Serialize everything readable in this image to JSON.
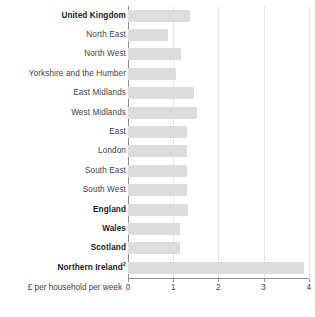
{
  "chart_data": {
    "type": "bar",
    "orientation": "horizontal",
    "title": "",
    "subtitle": "",
    "xlabel": "£ per household per week",
    "ylabel": "",
    "xlim": [
      0,
      4
    ],
    "xticks": [
      0,
      1,
      2,
      3,
      4
    ],
    "xtick_labels": [
      "0",
      "1",
      "2",
      "3",
      "4"
    ],
    "grid": "vertical",
    "legend": "none",
    "bar_color": "#dcdcdc",
    "axis_color": "#8d8d8d",
    "gridline_color": "#e6e6e6",
    "categories": [
      "United Kingdom",
      "North East",
      "North West",
      "Yorkshire and the Humber",
      "East Midlands",
      "West Midlands",
      "East",
      "London",
      "South East",
      "South West",
      "England",
      "Wales",
      "Scotland",
      "Northern Ireland"
    ],
    "values": [
      1.38,
      0.89,
      1.18,
      1.06,
      1.45,
      1.53,
      1.31,
      1.3,
      1.31,
      1.31,
      1.32,
      1.15,
      1.15,
      3.89
    ]
  },
  "rows": [
    {
      "label": "United Kingdom",
      "value": 1.38,
      "bold": true,
      "superscript": ""
    },
    {
      "label": "North East",
      "value": 0.89,
      "bold": false,
      "superscript": ""
    },
    {
      "label": "North West",
      "value": 1.18,
      "bold": false,
      "superscript": ""
    },
    {
      "label": "Yorkshire and the Humber",
      "value": 1.06,
      "bold": false,
      "superscript": ""
    },
    {
      "label": "East Midlands",
      "value": 1.45,
      "bold": false,
      "superscript": ""
    },
    {
      "label": "West Midlands",
      "value": 1.53,
      "bold": false,
      "superscript": ""
    },
    {
      "label": "East",
      "value": 1.31,
      "bold": false,
      "superscript": ""
    },
    {
      "label": "London",
      "value": 1.3,
      "bold": false,
      "superscript": ""
    },
    {
      "label": "South East",
      "value": 1.31,
      "bold": false,
      "superscript": ""
    },
    {
      "label": "South West",
      "value": 1.31,
      "bold": false,
      "superscript": ""
    },
    {
      "label": "England",
      "value": 1.32,
      "bold": true,
      "superscript": ""
    },
    {
      "label": "Wales",
      "value": 1.15,
      "bold": true,
      "superscript": ""
    },
    {
      "label": "Scotland",
      "value": 1.15,
      "bold": true,
      "superscript": ""
    },
    {
      "label": "Northern Ireland",
      "value": 3.89,
      "bold": true,
      "superscript": "2"
    }
  ],
  "axis": {
    "caption": "£ per household per week",
    "ticks": [
      "0",
      "1",
      "2",
      "3",
      "4"
    ]
  }
}
